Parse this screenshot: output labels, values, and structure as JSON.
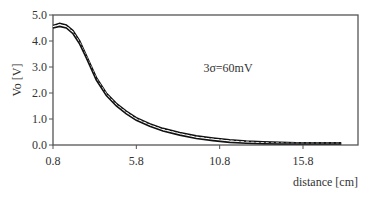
{
  "chart_data": {
    "type": "line",
    "title": "",
    "xlabel": "distance [cm]",
    "ylabel": "Vo [V]",
    "xlim": [
      0.8,
      19.1
    ],
    "ylim": [
      0.0,
      5.0
    ],
    "x_ticks": [
      "0.8",
      "5.8",
      "10.8",
      "15.8"
    ],
    "x_tick_values": [
      0.8,
      5.8,
      10.8,
      15.8
    ],
    "y_ticks": [
      "0.0",
      "1.0",
      "2.0",
      "3.0",
      "4.0",
      "5.0"
    ],
    "y_tick_values": [
      0.0,
      1.0,
      2.0,
      3.0,
      4.0,
      5.0
    ],
    "grid": false,
    "legend": null,
    "annotations": [
      {
        "text": "3σ=60mV",
        "x": 11.2,
        "y": 2.9
      }
    ],
    "series": [
      {
        "name": "upper bound",
        "style": "solid",
        "x": [
          0.8,
          1.2,
          1.6,
          2.0,
          2.4,
          2.8,
          3.4,
          4.0,
          4.6,
          5.2,
          5.8,
          6.6,
          7.4,
          8.4,
          9.4,
          10.4,
          11.4,
          12.4,
          13.4,
          14.4,
          15.4,
          16.4,
          17.4,
          18.1
        ],
        "values": [
          4.6,
          4.68,
          4.62,
          4.4,
          4.0,
          3.45,
          2.6,
          2.0,
          1.6,
          1.3,
          1.05,
          0.82,
          0.64,
          0.48,
          0.35,
          0.27,
          0.2,
          0.15,
          0.12,
          0.1,
          0.09,
          0.08,
          0.08,
          0.08
        ]
      },
      {
        "name": "mean",
        "style": "dashed",
        "x": [
          0.8,
          1.2,
          1.6,
          2.0,
          2.4,
          2.8,
          3.4,
          4.0,
          4.6,
          5.2,
          5.8,
          6.6,
          7.4,
          8.4,
          9.4,
          10.4,
          11.4,
          12.4,
          13.4,
          14.4,
          15.4,
          16.4,
          17.4,
          18.1
        ],
        "values": [
          4.55,
          4.62,
          4.56,
          4.34,
          3.94,
          3.4,
          2.55,
          1.95,
          1.55,
          1.25,
          1.0,
          0.77,
          0.59,
          0.43,
          0.3,
          0.22,
          0.15,
          0.11,
          0.08,
          0.07,
          0.06,
          0.06,
          0.06,
          0.06
        ]
      },
      {
        "name": "lower bound",
        "style": "solid",
        "x": [
          0.8,
          1.2,
          1.6,
          2.0,
          2.4,
          2.8,
          3.4,
          4.0,
          4.6,
          5.2,
          5.8,
          6.6,
          7.4,
          8.4,
          9.4,
          10.4,
          11.4,
          12.4,
          13.4,
          14.4,
          15.4,
          16.4,
          17.4,
          18.1
        ],
        "values": [
          4.5,
          4.56,
          4.5,
          4.28,
          3.88,
          3.35,
          2.5,
          1.9,
          1.5,
          1.2,
          0.95,
          0.72,
          0.54,
          0.38,
          0.25,
          0.17,
          0.1,
          0.07,
          0.05,
          0.04,
          0.04,
          0.04,
          0.04,
          0.04
        ]
      }
    ]
  },
  "labels": {
    "ylabel": "Vo [V]",
    "xlabel": "distance [cm]",
    "annotation": "3σ=60mV"
  }
}
